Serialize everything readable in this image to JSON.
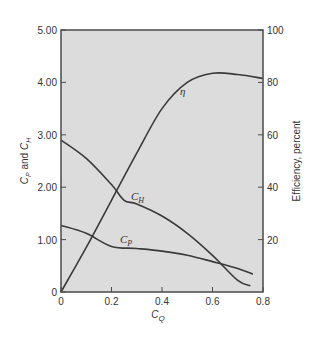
{
  "chart_data": {
    "type": "line",
    "title": "",
    "xlabel": "C_Q",
    "ylabel_left": "C_P and C_H",
    "ylabel_right": "Efficiency, percent",
    "xlim": [
      0,
      0.8
    ],
    "ylim_left": [
      0,
      5.0
    ],
    "ylim_right": [
      0,
      100
    ],
    "grid": false,
    "legend": "none (curves labeled inline)",
    "x_ticks": [
      "0",
      "0.2",
      "0.4",
      "0.6",
      "0.8"
    ],
    "y_left_ticks": [
      "0",
      "1.00",
      "2.00",
      "3.00",
      "4.00",
      "5.00"
    ],
    "y_right_ticks": [
      "20",
      "40",
      "60",
      "80",
      "100"
    ],
    "series": [
      {
        "name": "η",
        "axis": "right",
        "x": [
          0,
          0.1,
          0.2,
          0.3,
          0.4,
          0.5,
          0.6,
          0.7,
          0.8
        ],
        "values": [
          0,
          17,
          35,
          53,
          70,
          80,
          83.5,
          83,
          81.5
        ]
      },
      {
        "name": "C_H",
        "axis": "left",
        "x": [
          0,
          0.1,
          0.2,
          0.25,
          0.3,
          0.4,
          0.5,
          0.6,
          0.7,
          0.75
        ],
        "values": [
          2.9,
          2.55,
          2.05,
          1.75,
          1.68,
          1.45,
          1.12,
          0.7,
          0.22,
          0.12
        ]
      },
      {
        "name": "C_P",
        "axis": "left",
        "x": [
          0,
          0.1,
          0.2,
          0.3,
          0.4,
          0.5,
          0.6,
          0.7,
          0.76
        ],
        "values": [
          1.27,
          1.12,
          0.87,
          0.83,
          0.78,
          0.7,
          0.58,
          0.45,
          0.34
        ]
      }
    ],
    "annotations": [
      {
        "text": "η",
        "x": 0.48,
        "y_right": 80
      },
      {
        "text": "C_H",
        "x": 0.29,
        "y": 1.85
      },
      {
        "text": "C_P",
        "x": 0.27,
        "y": 1.05
      }
    ]
  },
  "labels": {
    "x_axis": "C",
    "x_axis_sub": "Q",
    "y_left_c1": "C",
    "y_left_s1": "P",
    "y_left_mid": " and ",
    "y_left_c2": "C",
    "y_left_s2": "H",
    "y_right": "Efficiency, percent",
    "eta": "η",
    "ch": "C",
    "ch_sub": "H",
    "cp": "C",
    "cp_sub": "P"
  },
  "colors": {
    "plot_bg": "#dcdcdc",
    "curve": "#3a3a3a",
    "frame": "#4a4a4a"
  }
}
